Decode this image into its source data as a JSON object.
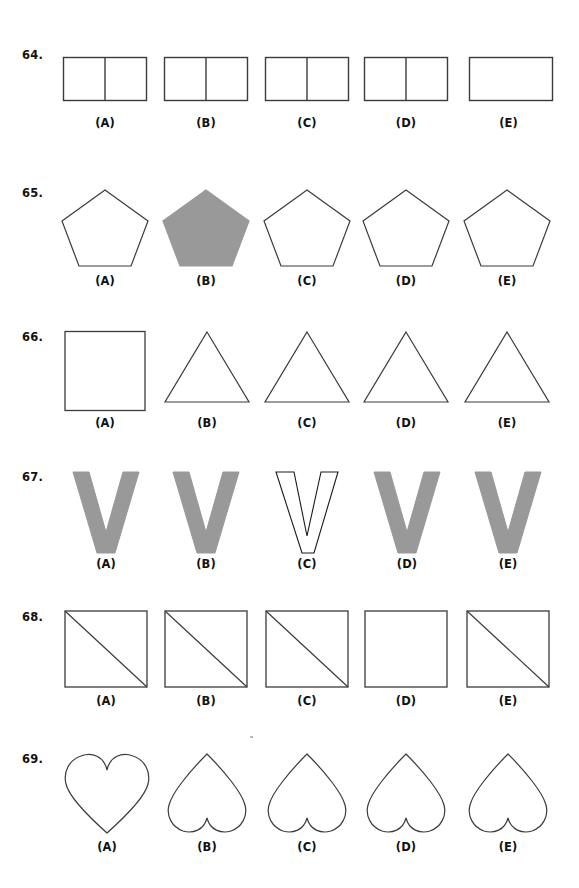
{
  "page": {
    "background_color": "#ffffff",
    "stroke_color": "#3b3b3b",
    "fill_gray": "#999999",
    "width": 579,
    "height": 888
  },
  "option_labels": [
    "(A)",
    "(B)",
    "(C)",
    "(D)",
    "(E)"
  ],
  "questions": [
    {
      "number": "64.",
      "top": 48,
      "label_top": 118,
      "options": [
        {
          "label": "(A)",
          "shape": "divided-rectangle",
          "filled": false,
          "divider": true
        },
        {
          "label": "(B)",
          "shape": "divided-rectangle",
          "filled": false,
          "divider": true
        },
        {
          "label": "(C)",
          "shape": "divided-rectangle",
          "filled": false,
          "divider": true
        },
        {
          "label": "(D)",
          "shape": "divided-rectangle",
          "filled": false,
          "divider": true
        },
        {
          "label": "(E)",
          "shape": "plain-rectangle",
          "filled": false,
          "divider": false
        }
      ]
    },
    {
      "number": "65.",
      "top": 186,
      "label_top": 272,
      "options": [
        {
          "label": "(A)",
          "shape": "pentagon",
          "filled": false
        },
        {
          "label": "(B)",
          "shape": "pentagon",
          "filled": true
        },
        {
          "label": "(C)",
          "shape": "pentagon",
          "filled": false
        },
        {
          "label": "(D)",
          "shape": "pentagon",
          "filled": false
        },
        {
          "label": "(E)",
          "shape": "pentagon",
          "filled": false
        }
      ]
    },
    {
      "number": "66.",
      "top": 330,
      "label_top": 413,
      "options": [
        {
          "label": "(A)",
          "shape": "square",
          "filled": false
        },
        {
          "label": "(B)",
          "shape": "triangle",
          "filled": false
        },
        {
          "label": "(C)",
          "shape": "triangle",
          "filled": false
        },
        {
          "label": "(D)",
          "shape": "triangle",
          "filled": false
        },
        {
          "label": "(E)",
          "shape": "triangle",
          "filled": false
        }
      ]
    },
    {
      "number": "67.",
      "top": 470,
      "label_top": 556,
      "options": [
        {
          "label": "(A)",
          "shape": "letter-v",
          "filled": true
        },
        {
          "label": "(B)",
          "shape": "letter-v",
          "filled": true
        },
        {
          "label": "(C)",
          "shape": "letter-v",
          "filled": false
        },
        {
          "label": "(D)",
          "shape": "letter-v",
          "filled": true
        },
        {
          "label": "(E)",
          "shape": "letter-v",
          "filled": true
        }
      ]
    },
    {
      "number": "68.",
      "top": 610,
      "label_top": 690,
      "options": [
        {
          "label": "(A)",
          "shape": "square-with-diagonal",
          "filled": false,
          "diagonal": true
        },
        {
          "label": "(B)",
          "shape": "square-with-diagonal",
          "filled": false,
          "diagonal": true
        },
        {
          "label": "(C)",
          "shape": "square-with-diagonal",
          "filled": false,
          "diagonal": true
        },
        {
          "label": "(D)",
          "shape": "plain-square",
          "filled": false,
          "diagonal": false
        },
        {
          "label": "(E)",
          "shape": "square-with-diagonal",
          "filled": false,
          "diagonal": true
        }
      ]
    },
    {
      "number": "69.",
      "top": 752,
      "label_top": 840,
      "options": [
        {
          "label": "(A)",
          "shape": "heart-upright",
          "filled": false
        },
        {
          "label": "(B)",
          "shape": "heart-inverted",
          "filled": false
        },
        {
          "label": "(C)",
          "shape": "heart-inverted",
          "filled": false
        },
        {
          "label": "(D)",
          "shape": "heart-inverted",
          "filled": false
        },
        {
          "label": "(E)",
          "shape": "heart-inverted",
          "filled": false
        }
      ]
    }
  ],
  "columns": [
    105,
    206,
    307,
    406,
    507
  ]
}
